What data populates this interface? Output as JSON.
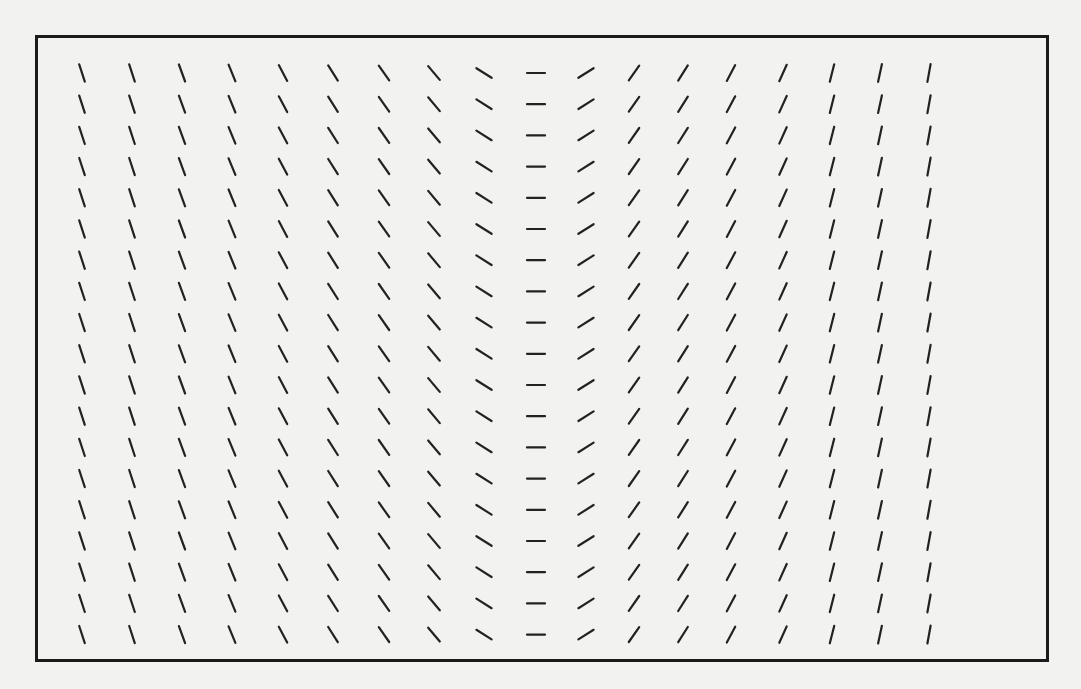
{
  "figure": {
    "kind": "slope-field",
    "frame": {
      "left": 35,
      "top": 35,
      "right": 1049,
      "bottom": 662,
      "border_color": "#1a1a1a"
    },
    "segment_color": "#222222",
    "segment_length": 18,
    "columns": {
      "x_positions": [
        82,
        132,
        182,
        232,
        283,
        333,
        384,
        434,
        484,
        536,
        586,
        634,
        683,
        731,
        783,
        832,
        880,
        929
      ],
      "angles_deg": [
        -72,
        -72,
        -70,
        -68,
        -62,
        -58,
        -55,
        -50,
        -32,
        0,
        32,
        55,
        58,
        62,
        66,
        76,
        78,
        80
      ]
    },
    "rows": {
      "first_y": 73,
      "spacing": 31.2,
      "count": 19
    }
  }
}
